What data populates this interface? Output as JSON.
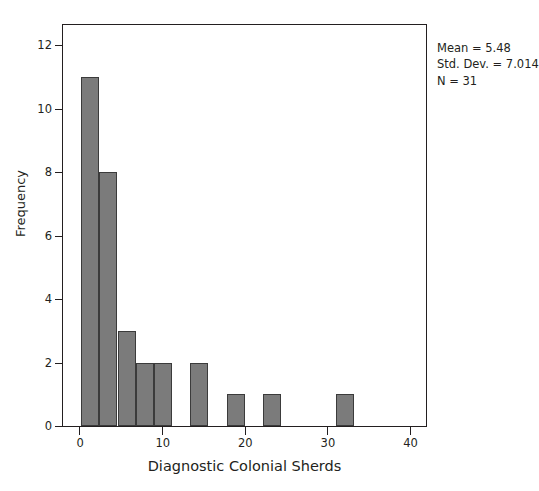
{
  "chart_data": {
    "type": "bar",
    "title": "",
    "xlabel": "Diagnostic Colonial Sherds",
    "ylabel": "Frequency",
    "xlim": [
      -2.2,
      42
    ],
    "ylim": [
      0,
      12.7
    ],
    "xticks": [
      0,
      10,
      20,
      30,
      40
    ],
    "xtick_labels": [
      "0",
      "10",
      "20",
      "30",
      "40"
    ],
    "yticks": [
      0,
      2,
      4,
      6,
      8,
      10,
      12
    ],
    "ytick_labels": [
      "0",
      "2",
      "4",
      "6",
      "8",
      "10",
      "12"
    ],
    "grid": false,
    "legend": false,
    "bin_width": 2.2,
    "bars": [
      {
        "bin_start": 0.0,
        "bin_end": 2.2,
        "center": 1.1,
        "value": 11
      },
      {
        "bin_start": 2.2,
        "bin_end": 4.4,
        "center": 3.3,
        "value": 8
      },
      {
        "bin_start": 4.4,
        "bin_end": 6.6,
        "center": 5.5,
        "value": 3
      },
      {
        "bin_start": 6.6,
        "bin_end": 8.8,
        "center": 7.7,
        "value": 2
      },
      {
        "bin_start": 8.8,
        "bin_end": 11.0,
        "center": 9.9,
        "value": 2
      },
      {
        "bin_start": 13.2,
        "bin_end": 15.4,
        "center": 14.3,
        "value": 2
      },
      {
        "bin_start": 17.6,
        "bin_end": 19.8,
        "center": 18.7,
        "value": 1
      },
      {
        "bin_start": 22.0,
        "bin_end": 24.2,
        "center": 23.1,
        "value": 1
      },
      {
        "bin_start": 30.8,
        "bin_end": 33.0,
        "center": 31.9,
        "value": 1
      }
    ],
    "categories": [
      "0-2.2",
      "2.2-4.4",
      "4.4-6.6",
      "6.6-8.8",
      "8.8-11",
      "13.2-15.4",
      "17.6-19.8",
      "22-24.2",
      "30.8-33"
    ],
    "values": [
      11,
      8,
      3,
      2,
      2,
      2,
      1,
      1,
      1
    ],
    "annotations": {
      "mean": "Mean = 5.48",
      "std_dev": "Std. Dev. = 7.014",
      "n": "N = 31"
    },
    "colors": {
      "bar_fill": "#7b7b7b",
      "bar_edge": "#3b3b3b",
      "axis": "#231f20",
      "background": "#ffffff"
    }
  }
}
